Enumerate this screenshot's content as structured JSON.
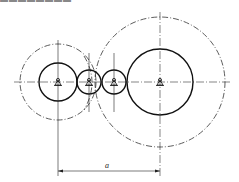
{
  "caption": "▬▬▬▬▬▬▬▬",
  "diagram": {
    "type": "gear train sketch",
    "gears": [
      {
        "name": "gear-1",
        "cx": 58,
        "cy": 82,
        "r": 19,
        "dashed_r": 38
      },
      {
        "name": "gear-2",
        "cx": 89,
        "cy": 82,
        "r": 12
      },
      {
        "name": "gear-3",
        "cx": 114,
        "cy": 82,
        "r": 12
      },
      {
        "name": "gear-4",
        "cx": 160,
        "cy": 82,
        "r": 33,
        "dashed_r": 65
      }
    ],
    "dimension": {
      "label": "a",
      "from_x": 58,
      "to_x": 160,
      "y": 171
    }
  }
}
